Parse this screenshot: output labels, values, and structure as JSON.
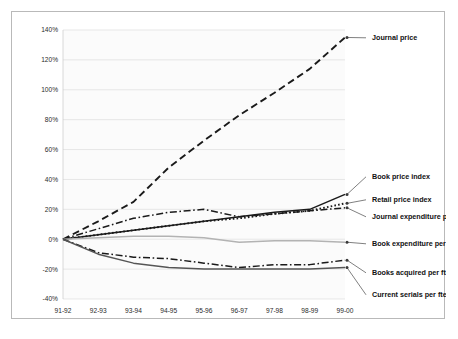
{
  "chart_data": {
    "type": "line",
    "title": "",
    "subtitle": "",
    "xlabel": "",
    "ylabel": "",
    "x": [
      "91-92",
      "92-93",
      "93-94",
      "94-95",
      "95-96",
      "96-97",
      "97-98",
      "98-99",
      "99-00"
    ],
    "categories": [
      "91-92",
      "92-93",
      "93-94",
      "94-95",
      "95-96",
      "96-97",
      "97-98",
      "98-99",
      "99-00"
    ],
    "ylim": [
      -40,
      140
    ],
    "ytick_values": [
      140,
      120,
      100,
      80,
      60,
      40,
      20,
      0,
      -20,
      -40
    ],
    "ytick_labels": [
      "140%",
      "120%",
      "100%",
      "80%",
      "60%",
      "40%",
      "20%",
      "0%",
      "-20%",
      "-40%"
    ],
    "grid": true,
    "legend_position": "right-inline-labels",
    "series": [
      {
        "name": "Journal price",
        "style": "dashed",
        "color": "#1a1a1a",
        "values": [
          0,
          12,
          25,
          48,
          66,
          83,
          98,
          114,
          135
        ]
      },
      {
        "name": "Book price index",
        "style": "solid",
        "color": "#1a1a1a",
        "values": [
          0,
          3,
          6,
          9,
          12,
          15,
          18,
          20,
          30
        ]
      },
      {
        "name": "Retail price index",
        "style": "dotted",
        "color": "#1a1a1a",
        "values": [
          0,
          3,
          6,
          9,
          12,
          14,
          17,
          19,
          24
        ]
      },
      {
        "name": "Journal expenditure per fte",
        "style": "dash-dot",
        "color": "#1a1a1a",
        "values": [
          0,
          7,
          14,
          18,
          20,
          15,
          17,
          19,
          21
        ]
      },
      {
        "name": "Book expenditure per fte",
        "style": "solid-gray",
        "color": "#b3b3b3",
        "values": [
          0,
          1,
          2,
          2,
          1,
          -2,
          -1,
          -1,
          -2
        ]
      },
      {
        "name": "Books acquired per fte",
        "style": "dash-dot",
        "color": "#1a1a1a",
        "values": [
          0,
          -9,
          -12,
          -13,
          -16,
          -19,
          -17,
          -17,
          -14
        ]
      },
      {
        "name": "Current serials per fte",
        "style": "solid",
        "color": "#555555",
        "values": [
          0,
          -10,
          -16,
          -19,
          -20,
          -20,
          -20,
          -20,
          -19
        ]
      }
    ],
    "labels": [
      {
        "text": "Journal price",
        "series": "Journal price"
      },
      {
        "text": "Book price index",
        "series": "Book price index"
      },
      {
        "text": "Retail price index",
        "series": "Retail price index"
      },
      {
        "text": "Journal expenditure per fte",
        "series": "Journal expenditure per fte"
      },
      {
        "text": "Book expenditure per fte",
        "series": "Book expenditure per fte"
      },
      {
        "text": "Books acquired per fte",
        "series": "Books acquired per fte"
      },
      {
        "text": "Current serials per fte",
        "series": "Current serials per fte"
      }
    ]
  }
}
